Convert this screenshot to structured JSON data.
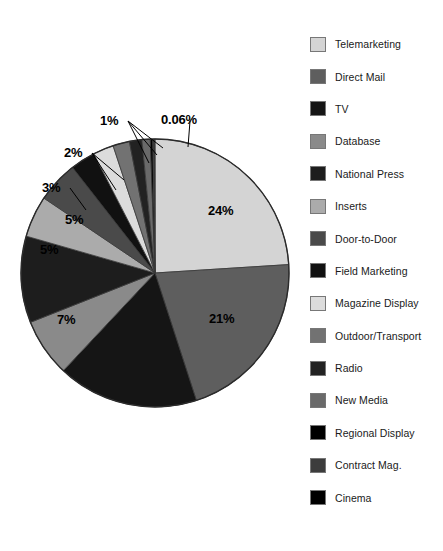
{
  "chart_data": {
    "type": "pie",
    "title": "",
    "subtitle": "",
    "xlabel": "",
    "ylabel": "",
    "legend_position": "right",
    "grid": false,
    "start_angle_deg": 0,
    "direction": "clockwise",
    "categories": [
      "Telemarketing",
      "Direct Mail",
      "TV",
      "Database",
      "National Press",
      "Inserts",
      "Door-to-Door",
      "Field Marketing",
      "Magazine Display",
      "Outdoor/Transport",
      "Radio",
      "New Media",
      "Regional Display",
      "Contract Mag.",
      "Cinema"
    ],
    "values": [
      24,
      21,
      17,
      7,
      10.44,
      5,
      5,
      3,
      2.5,
      2,
      1.5,
      1,
      0.3,
      0.2,
      0.06
    ],
    "colors": [
      "#d4d4d4",
      "#5e5e5e",
      "#151515",
      "#8a8a8a",
      "#1d1d1d",
      "#ababab",
      "#4a4a4a",
      "#111111",
      "#dcdcdc",
      "#727272",
      "#222222",
      "#6a6a6a",
      "#000000",
      "#3c3c3c",
      "#000000"
    ],
    "slice_labels": [
      {
        "text": "24%",
        "category": "Telemarketing",
        "value": 24,
        "callout": false
      },
      {
        "text": "21%",
        "category": "Direct Mail",
        "value": 21,
        "callout": false
      },
      {
        "text": "7%",
        "category": "Database",
        "value": 7,
        "callout": false
      },
      {
        "text": "5%",
        "category": "Inserts",
        "value": 5,
        "callout": false
      },
      {
        "text": "5%",
        "category": "Door-to-Door",
        "value": 5,
        "callout": false
      },
      {
        "text": "3%",
        "category": "Field Marketing",
        "value": 3,
        "callout": true
      },
      {
        "text": "2%",
        "category": "Outdoor/Transport",
        "value": 2,
        "callout": true
      },
      {
        "text": "1%",
        "category": "New Media",
        "value": 1,
        "callout": true
      },
      {
        "text": "0.06%",
        "category": "Cinema",
        "value": 0.06,
        "callout": true
      }
    ]
  },
  "pie": {
    "labels": {
      "telemarketing": "24%",
      "direct_mail": "21%",
      "database": "7%",
      "inserts": "5%",
      "door_to_door": "5%",
      "field_marketing": "3%",
      "outdoor_transport": "2%",
      "new_media": "1%",
      "cinema": "0.06%"
    }
  },
  "legend": {
    "items": [
      {
        "label": "Telemarketing",
        "color": "#d4d4d4"
      },
      {
        "label": "Direct Mail",
        "color": "#5e5e5e"
      },
      {
        "label": "TV",
        "color": "#151515"
      },
      {
        "label": "Database",
        "color": "#8a8a8a"
      },
      {
        "label": "National Press",
        "color": "#1d1d1d"
      },
      {
        "label": "Inserts",
        "color": "#ababab"
      },
      {
        "label": "Door-to-Door",
        "color": "#4a4a4a"
      },
      {
        "label": "Field Marketing",
        "color": "#111111"
      },
      {
        "label": "Magazine Display",
        "color": "#dcdcdc"
      },
      {
        "label": "Outdoor/Transport",
        "color": "#727272"
      },
      {
        "label": "Radio",
        "color": "#222222"
      },
      {
        "label": "New Media",
        "color": "#6a6a6a"
      },
      {
        "label": "Regional Display",
        "color": "#000000"
      },
      {
        "label": "Contract Mag.",
        "color": "#3c3c3c"
      },
      {
        "label": "Cinema",
        "color": "#000000"
      }
    ]
  }
}
